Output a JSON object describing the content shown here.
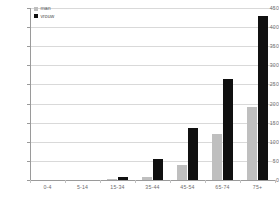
{
  "chart_data": {
    "type": "bar",
    "title": "",
    "subtitle": "",
    "xlabel": "",
    "ylabel": "",
    "categories": [
      "0-4",
      "5-14",
      "15-34",
      "35-44",
      "45-54",
      "65-74",
      "75+"
    ],
    "series": [
      {
        "name": "man",
        "color": "#bfbfbf",
        "values": [
          0,
          0,
          2,
          8,
          40,
          120,
          190
        ]
      },
      {
        "name": "vrouw",
        "color": "#101010",
        "values": [
          0,
          0,
          8,
          55,
          135,
          265,
          430
        ]
      }
    ],
    "ylim": [
      0,
      450
    ],
    "ytick_values": [
      450,
      400,
      350,
      300,
      250,
      200,
      150,
      100,
      50,
      0
    ],
    "ytick_labels": [
      "450",
      "400",
      "350",
      "300",
      "250",
      "200",
      "150",
      "100",
      "50",
      "0"
    ],
    "grid": true,
    "grid_axis": "y",
    "legend_position": "top-left",
    "legend": [
      "man",
      "vrouw"
    ]
  }
}
